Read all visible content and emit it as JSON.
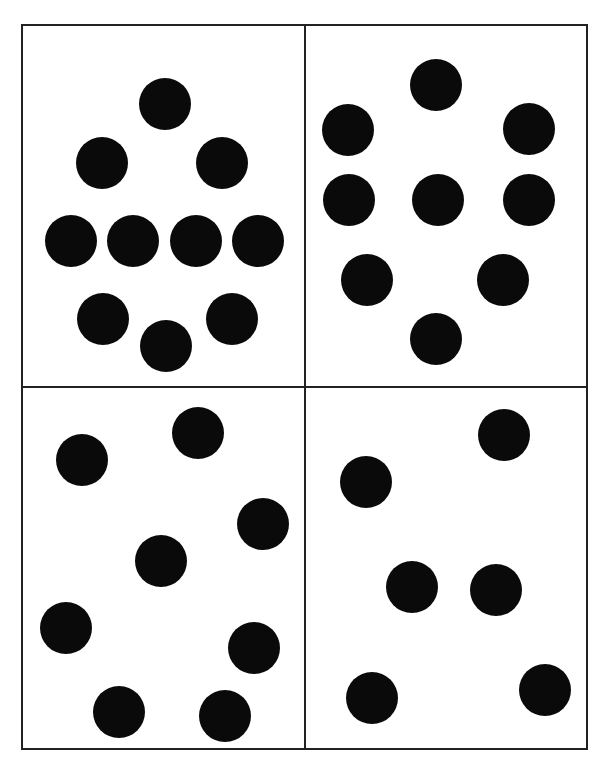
{
  "figure": {
    "width": 606,
    "height": 767,
    "background": "#ffffff",
    "line_color": "#222222",
    "dot_color": "#0a0a0a",
    "dot_radius": 26,
    "frame": {
      "x": 22,
      "y": 25,
      "w": 565,
      "h": 724
    },
    "divider_x": 305,
    "divider_y": 387,
    "panels": [
      {
        "name": "top-left",
        "dot_count": 10,
        "dots": [
          [
            165,
            104
          ],
          [
            102,
            163
          ],
          [
            222,
            163
          ],
          [
            71,
            241
          ],
          [
            133,
            241
          ],
          [
            196,
            241
          ],
          [
            258,
            241
          ],
          [
            103,
            319
          ],
          [
            232,
            319
          ],
          [
            166,
            346
          ]
        ]
      },
      {
        "name": "top-right",
        "dot_count": 9,
        "dots": [
          [
            436,
            85
          ],
          [
            348,
            130
          ],
          [
            529,
            129
          ],
          [
            349,
            200
          ],
          [
            438,
            200
          ],
          [
            529,
            200
          ],
          [
            367,
            280
          ],
          [
            503,
            280
          ],
          [
            436,
            339
          ]
        ]
      },
      {
        "name": "bottom-left",
        "dot_count": 8,
        "dots": [
          [
            82,
            460
          ],
          [
            198,
            433
          ],
          [
            263,
            524
          ],
          [
            161,
            561
          ],
          [
            66,
            628
          ],
          [
            254,
            648
          ],
          [
            119,
            712
          ],
          [
            225,
            716
          ]
        ]
      },
      {
        "name": "bottom-right",
        "dot_count": 6,
        "dots": [
          [
            366,
            482
          ],
          [
            504,
            435
          ],
          [
            412,
            587
          ],
          [
            496,
            590
          ],
          [
            372,
            698
          ],
          [
            545,
            690
          ]
        ]
      }
    ]
  }
}
